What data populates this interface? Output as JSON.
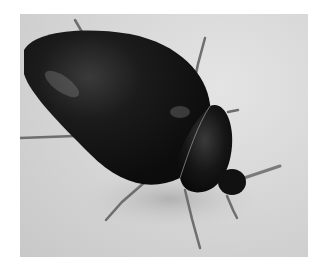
{
  "image": {
    "subject": "black beetle on a light textured surface",
    "background_color": "#d6d6d6",
    "body_color": "#151515"
  }
}
